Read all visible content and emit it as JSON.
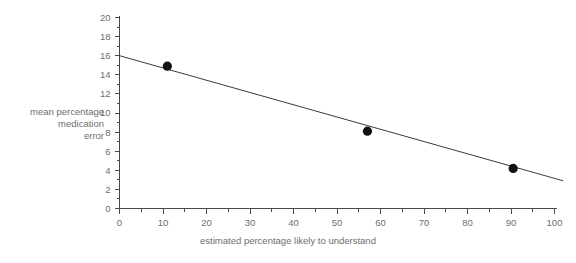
{
  "chart_data": {
    "type": "scatter",
    "title": "",
    "subtitle": "",
    "xlabel": "estimated percentage likely to understand",
    "ylabel": "mean percentage medication error",
    "ylabel_lines": [
      "mean percentage",
      "medication",
      "error"
    ],
    "xlim": [
      0,
      100
    ],
    "ylim": [
      0,
      20
    ],
    "x_ticks": [
      0,
      10,
      20,
      30,
      40,
      50,
      60,
      70,
      80,
      90,
      100
    ],
    "x_tick_labels": [
      "0",
      "10",
      "20",
      "30",
      "40",
      "50",
      "60",
      "70",
      "80",
      "90",
      "100"
    ],
    "x_minor_step": 5,
    "y_ticks": [
      0,
      2,
      4,
      6,
      8,
      10,
      12,
      14,
      16,
      18,
      20
    ],
    "y_tick_labels": [
      "0",
      "2",
      "4",
      "6",
      "8",
      "10",
      "12",
      "14",
      "16",
      "18",
      "20"
    ],
    "y_minor_step": 1,
    "grid": false,
    "legend": false,
    "legend_position": "none",
    "points": [
      {
        "x": 11.0,
        "y": 14.9
      },
      {
        "x": 57.0,
        "y": 8.1
      },
      {
        "x": 90.5,
        "y": 4.2
      }
    ],
    "series": [
      {
        "name": "observations",
        "type": "scatter",
        "x": [
          11.0,
          57.0,
          90.5
        ],
        "values": [
          14.9,
          8.1,
          4.2
        ],
        "marker": "filled-circle",
        "color": "#121212"
      },
      {
        "name": "line of best fit",
        "type": "line",
        "x": [
          0,
          102
        ],
        "values": [
          16.0,
          2.9
        ],
        "color": "#3b3b3b"
      }
    ],
    "fit_line": {
      "x_start": 0,
      "y_start": 16.0,
      "x_end": 102,
      "y_end": 2.9,
      "intercept": 16.0,
      "slope": -0.1284
    },
    "colors": {
      "axis": "#4a4a4a",
      "text": "#6e6e6e",
      "marker": "#121212",
      "line": "#3b3b3b",
      "background": "#ffffff"
    }
  }
}
